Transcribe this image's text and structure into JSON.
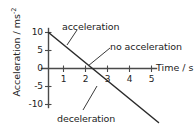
{
  "chart_data": {
    "type": "line",
    "title": "",
    "xlabel": "Time / s",
    "ylabel_text": "Acceleration / ms",
    "ylabel_exponent": "-2",
    "xlim": [
      0,
      5.8
    ],
    "ylim": [
      -16,
      11
    ],
    "grid": false,
    "legend": "none",
    "x": [
      0,
      2,
      5
    ],
    "y": [
      10,
      0,
      -15
    ],
    "series": [
      {
        "name": "acceleration-time line",
        "x": [
          0,
          2,
          5
        ],
        "values": [
          10,
          0,
          -15
        ]
      }
    ],
    "xticks": [
      1,
      2,
      3,
      4,
      5
    ],
    "xtick_labels": [
      "1",
      "2",
      "3",
      "4",
      "5"
    ],
    "yticks": [
      10,
      5,
      0,
      -5,
      -10
    ],
    "ytick_labels": [
      "10",
      "5",
      "0",
      "-5",
      "-10"
    ],
    "annotations": [
      {
        "id": "acceleration",
        "text": "acceleration",
        "points_to": "positive segment of line"
      },
      {
        "id": "no-acceleration",
        "text": "no acceleration",
        "points_to": "zero crossing at t = 2 s"
      },
      {
        "id": "deceleration",
        "text": "deceleration",
        "points_to": "negative segment of line"
      }
    ],
    "colors": {
      "line": "#2b2b2b",
      "axis": "#4a4a4a",
      "text": "#232323",
      "background": "#ffffff"
    }
  }
}
